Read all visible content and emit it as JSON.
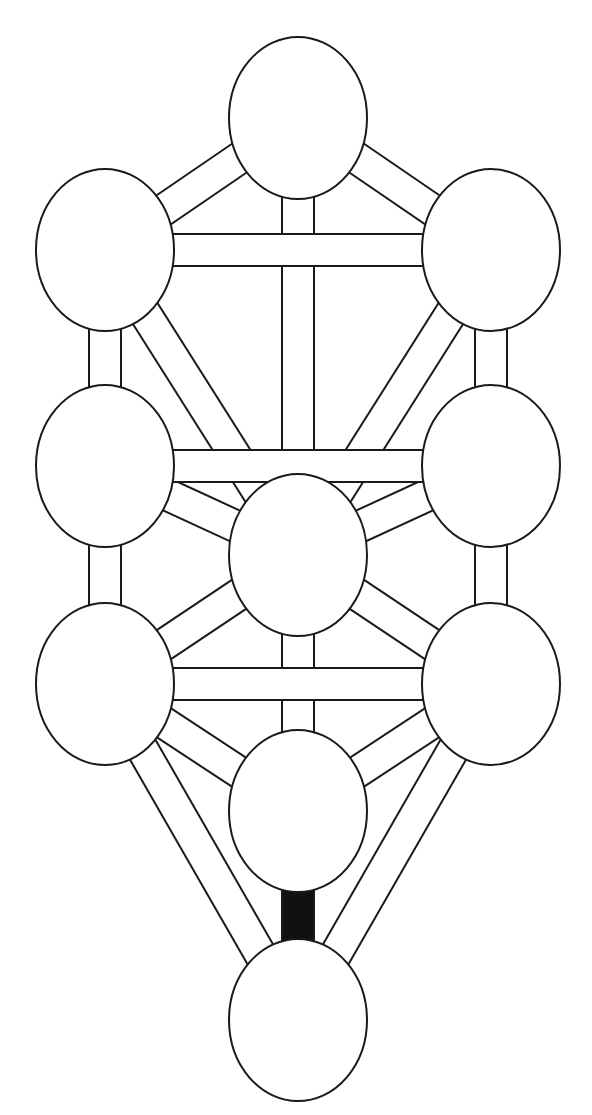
{
  "diagram": {
    "title": "",
    "type": "tree-of-life",
    "colors": {
      "stroke": "#1a1a1a",
      "fill": "#ffffff",
      "highlight": "#111111"
    },
    "node_rx": 69,
    "node_ry": 81,
    "path_width": 32,
    "nodes": [
      {
        "id": "n1",
        "cx": 298,
        "cy": 118
      },
      {
        "id": "n2",
        "cx": 491,
        "cy": 250
      },
      {
        "id": "n3",
        "cx": 105,
        "cy": 250
      },
      {
        "id": "n4",
        "cx": 491,
        "cy": 466
      },
      {
        "id": "n5",
        "cx": 105,
        "cy": 466
      },
      {
        "id": "n6",
        "cx": 298,
        "cy": 555
      },
      {
        "id": "n7",
        "cx": 491,
        "cy": 684
      },
      {
        "id": "n8",
        "cx": 105,
        "cy": 684
      },
      {
        "id": "n9",
        "cx": 298,
        "cy": 811
      },
      {
        "id": "n10",
        "cx": 298,
        "cy": 1020
      }
    ],
    "paths": [
      {
        "from": "n1",
        "to": "n2",
        "filled": false
      },
      {
        "from": "n1",
        "to": "n3",
        "filled": false
      },
      {
        "from": "n1",
        "to": "n6",
        "filled": false
      },
      {
        "from": "n2",
        "to": "n3",
        "filled": false
      },
      {
        "from": "n2",
        "to": "n4",
        "filled": false
      },
      {
        "from": "n2",
        "to": "n6",
        "filled": false
      },
      {
        "from": "n3",
        "to": "n5",
        "filled": false
      },
      {
        "from": "n3",
        "to": "n6",
        "filled": false
      },
      {
        "from": "n4",
        "to": "n5",
        "filled": false
      },
      {
        "from": "n4",
        "to": "n6",
        "filled": false
      },
      {
        "from": "n4",
        "to": "n7",
        "filled": false
      },
      {
        "from": "n5",
        "to": "n6",
        "filled": false
      },
      {
        "from": "n5",
        "to": "n8",
        "filled": false
      },
      {
        "from": "n6",
        "to": "n7",
        "filled": false
      },
      {
        "from": "n6",
        "to": "n8",
        "filled": false
      },
      {
        "from": "n6",
        "to": "n9",
        "filled": false
      },
      {
        "from": "n7",
        "to": "n8",
        "filled": false
      },
      {
        "from": "n7",
        "to": "n9",
        "filled": false
      },
      {
        "from": "n7",
        "to": "n10",
        "filled": false
      },
      {
        "from": "n8",
        "to": "n9",
        "filled": false
      },
      {
        "from": "n8",
        "to": "n10",
        "filled": false
      },
      {
        "from": "n9",
        "to": "n10",
        "filled": true
      }
    ]
  }
}
